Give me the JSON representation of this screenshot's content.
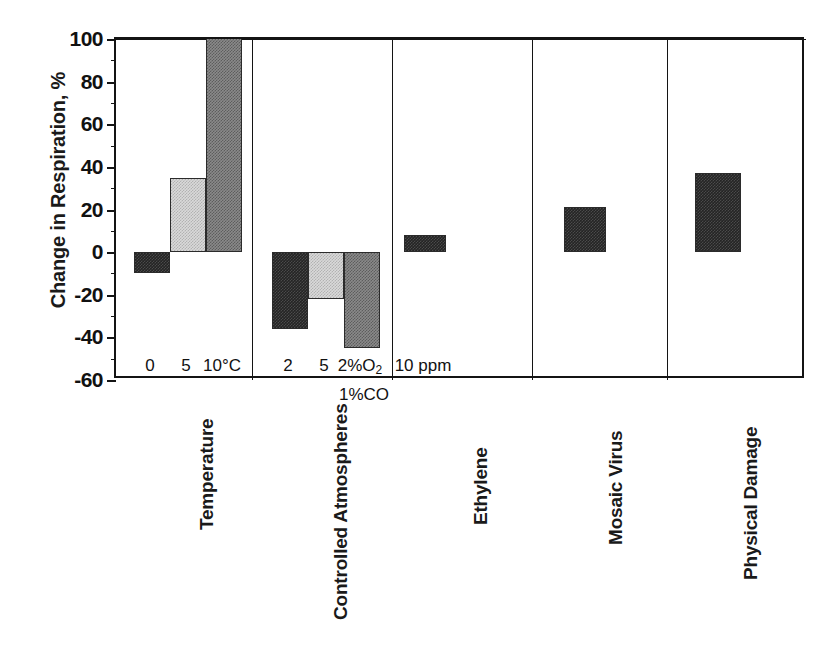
{
  "chart_data": {
    "type": "bar",
    "title": "",
    "subtitle": "",
    "xlabel": "",
    "ylabel": "Change in Respiration, %",
    "ylim": [
      -60,
      100
    ],
    "ytick_step": 20,
    "yticks": [
      "100",
      "80",
      "60",
      "40",
      "20",
      "0",
      "-20",
      "-40",
      "-60"
    ],
    "ytick_values": [
      100,
      80,
      60,
      40,
      20,
      0,
      -20,
      -40,
      -60
    ],
    "minor_tick_step": 10,
    "grid": false,
    "legend": "none",
    "zero_reference_line": true,
    "panels": [
      {
        "name": "Temperature",
        "label": "Temperature",
        "categories": [
          "0",
          "5",
          "10°C"
        ],
        "values": [
          -10,
          35,
          100
        ],
        "clipped": [
          false,
          false,
          true
        ],
        "fills": [
          "dark",
          "light",
          "medium"
        ]
      },
      {
        "name": "Controlled Atmospheres",
        "label": "Controlled Atmospheres",
        "categories": [
          "2",
          "5",
          "2%O₂"
        ],
        "category_sublabels": [
          "",
          "",
          "1%CO"
        ],
        "values": [
          -36,
          -22,
          -45
        ],
        "clipped": [
          false,
          false,
          false
        ],
        "fills": [
          "dark",
          "light",
          "medium"
        ]
      },
      {
        "name": "Ethylene",
        "label": "Ethylene",
        "categories": [
          "10 ppm"
        ],
        "values": [
          8
        ],
        "clipped": [
          false
        ],
        "fills": [
          "dark"
        ]
      },
      {
        "name": "Mosaic Virus",
        "label": "Mosaic Virus",
        "categories": [
          ""
        ],
        "values": [
          21
        ],
        "clipped": [
          false
        ],
        "fills": [
          "dark"
        ]
      },
      {
        "name": "Physical Damage",
        "label": "Physical Damage",
        "categories": [
          ""
        ],
        "values": [
          37
        ],
        "clipped": [
          false
        ],
        "fills": [
          "dark"
        ]
      }
    ]
  },
  "colors": {
    "axis": "#141414",
    "fill_dark": "#242424",
    "fill_light": "#d9d9d9",
    "fill_medium": "#8a8a8a",
    "background": "#ffffff"
  },
  "axis": {
    "y_title": "Change in Respiration, %"
  }
}
